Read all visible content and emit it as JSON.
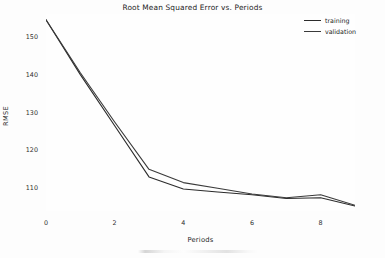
{
  "chart_data": {
    "type": "line",
    "title": "Root Mean Squared Error vs. Periods",
    "xlabel": "Periods",
    "ylabel": "RMSE",
    "x": [
      0,
      1,
      2,
      3,
      4,
      5,
      6,
      7,
      8,
      9
    ],
    "series": [
      {
        "name": "training",
        "color": "#2b2b2b",
        "values": [
          154.5,
          140.0,
          126.5,
          113.0,
          109.8,
          109.0,
          108.3,
          107.3,
          107.5,
          105.3
        ]
      },
      {
        "name": "validation",
        "color": "#3a3a3a",
        "values": [
          154.5,
          140.5,
          127.5,
          115.0,
          111.5,
          110.0,
          108.5,
          107.5,
          108.3,
          105.5
        ]
      }
    ],
    "xticks": [
      0,
      2,
      4,
      6,
      8
    ],
    "xtick_labels": [
      "0",
      "2",
      "4",
      "6",
      "8"
    ],
    "yticks": [
      110,
      120,
      130,
      140,
      150
    ],
    "ytick_labels": [
      "110",
      "120",
      "130",
      "140",
      "150"
    ],
    "xlim": [
      0,
      9
    ],
    "ylim": [
      104.0,
      156.0
    ],
    "grid": false,
    "legend_position": "upper right",
    "background_color": "#fdfdfd",
    "line_width": 1.1
  },
  "legend": {
    "entries": [
      {
        "label": "training"
      },
      {
        "label": "validation"
      }
    ]
  }
}
